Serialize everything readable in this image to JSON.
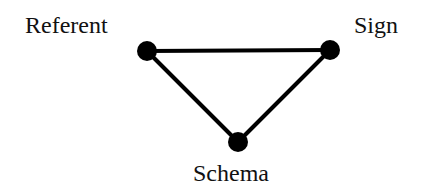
{
  "diagram": {
    "type": "semiotic-triangle",
    "colors": {
      "background": "#ffffff",
      "stroke": "#000000",
      "node": "#000000",
      "text": "#111111"
    },
    "nodes": [
      {
        "id": "referent",
        "label": "Referent",
        "x": 147,
        "y": 51
      },
      {
        "id": "sign",
        "label": "Sign",
        "x": 330,
        "y": 50
      },
      {
        "id": "schema",
        "label": "Schema",
        "x": 238,
        "y": 142
      }
    ],
    "edges": [
      {
        "from": "referent",
        "to": "sign"
      },
      {
        "from": "sign",
        "to": "schema"
      },
      {
        "from": "schema",
        "to": "referent"
      }
    ]
  }
}
